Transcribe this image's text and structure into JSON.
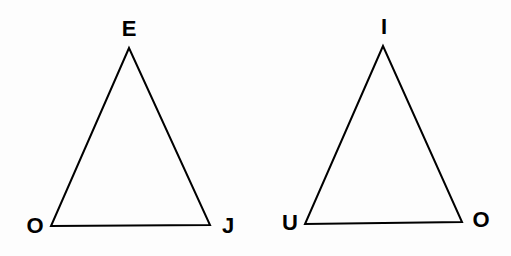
{
  "triangles": [
    {
      "name": "left",
      "vertices": {
        "top": "E",
        "bottom_left": "O",
        "bottom_right": "J"
      },
      "points": [
        [
          129,
          48
        ],
        [
          51,
          226
        ],
        [
          210,
          225
        ]
      ],
      "label_positions": {
        "top": [
          129,
          29
        ],
        "bottom_left": [
          35,
          226
        ],
        "bottom_right": [
          228,
          226
        ]
      }
    },
    {
      "name": "right",
      "vertices": {
        "top": "I",
        "bottom_left": "U",
        "bottom_right": "O"
      },
      "points": [
        [
          383,
          46
        ],
        [
          305,
          224
        ],
        [
          462,
          222
        ]
      ],
      "label_positions": {
        "top": [
          384,
          27
        ],
        "bottom_left": [
          290,
          223
        ],
        "bottom_right": [
          481,
          220
        ]
      }
    }
  ],
  "colors": {
    "stroke": "#000000",
    "background": "#fdfdfd"
  }
}
